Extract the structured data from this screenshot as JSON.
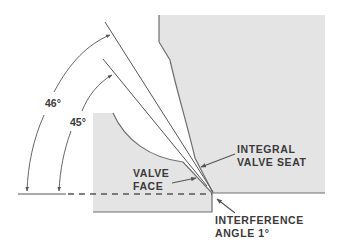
{
  "diagram": {
    "labels": {
      "angle_46": "46°",
      "angle_45": "45°",
      "valve_seat_line1": "INTEGRAL",
      "valve_seat_line2": "VALVE SEAT",
      "valve_face_line1": "VALVE",
      "valve_face_line2": "FACE",
      "interference_line1": "INTERFERENCE",
      "interference_line2": "ANGLE 1°"
    },
    "colors": {
      "fill": "#e4e4e4",
      "outline": "#6e6e6e",
      "line": "#555555",
      "text": "#3a3a3a",
      "background": "#ffffff"
    },
    "angles": {
      "seat_angle_deg": 46,
      "face_angle_deg": 45,
      "interference_angle_deg": 1
    }
  }
}
